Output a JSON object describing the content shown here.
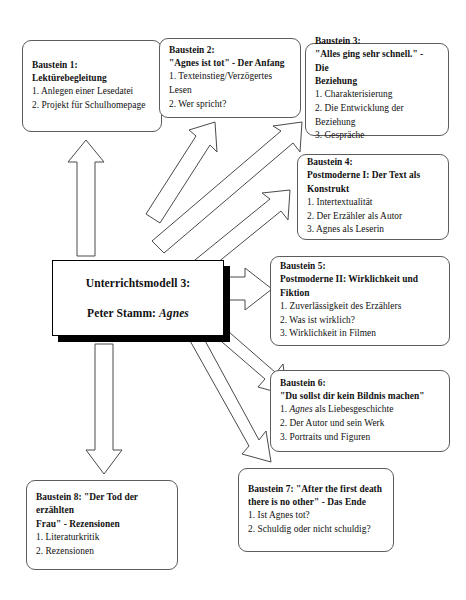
{
  "document": {
    "title": "Unterrichtsmodell 3: Peter Stamm: Agnes",
    "type": "organizational-flow-diagram"
  },
  "center_node": {
    "name": "unterrichtsmodell-center-node",
    "line1": "Unterrichtsmodell 3:",
    "line2_prefix": "Peter Stamm: ",
    "line2_italic": "Agnes"
  },
  "nodes": [
    {
      "id": "baustein-1",
      "heading_line1": "Baustein 1:",
      "heading_line2": "Lektürebegleitung",
      "items": [
        "1. Anlegen einer Lesedatei",
        "2. Projekt für Schulhomepage"
      ]
    },
    {
      "id": "baustein-2",
      "heading_line1": "Baustein 2:",
      "heading_line2": "\"Agnes ist tot\" - Der Anfang",
      "items": [
        "1. Texteinstieg/Verzögertes Lesen",
        "2. Wer spricht?"
      ]
    },
    {
      "id": "baustein-3",
      "heading_line1": "Baustein 3:",
      "heading_line2": "\"Alles ging sehr schnell.\" - Die",
      "heading_line3": "Beziehung",
      "items": [
        "1. Charakterisierung",
        "2. Die Entwicklung der Beziehung",
        "3. Gespräche"
      ]
    },
    {
      "id": "baustein-4",
      "heading_line1": "Baustein 4:",
      "heading_line2": "Postmoderne I: Der Text als",
      "heading_line3": "Konstrukt",
      "items": [
        "1. Intertextualität",
        "2. Der Erzähler als Autor",
        "3. Agnes als Leserin"
      ]
    },
    {
      "id": "baustein-5",
      "heading_line1": "Baustein 5:",
      "heading_line2": "Postmoderne II: Wirklichkeit und",
      "heading_line3": "Fiktion",
      "items": [
        "1. Zuverlässigkeit des Erzählers",
        "2. Was ist wirklich?",
        "3. Wirklichkeit in  Filmen"
      ]
    },
    {
      "id": "baustein-6",
      "heading_line1": "Baustein 6:",
      "heading_line2": "\"Du sollst dir kein Bildnis machen\"",
      "item1_italic": "Agnes",
      "item1_suffix": " als Liebesgeschichte",
      "item1_prefix": "1. ",
      "items": [
        "2. Der Autor und sein Werk",
        "3. Portraits und Figuren"
      ]
    },
    {
      "id": "baustein-7",
      "heading_line1": "Baustein 7: \"After the first death",
      "heading_line2": "there is no other\" - Das Ende",
      "items": [
        "1. Ist Agnes tot?",
        "2. Schuldig oder nicht schuldig?"
      ]
    },
    {
      "id": "baustein-8",
      "heading_line1": "Baustein 8: \"Der Tod der erzählten",
      "heading_line2": "Frau\" - Rezensionen",
      "items": [
        "1. Literaturkritik",
        "2. Rezensionen"
      ]
    }
  ],
  "connectors": [
    {
      "id": "arrow-to-baustein-1",
      "direction": "up"
    },
    {
      "id": "arrow-to-baustein-2",
      "direction": "up-right"
    },
    {
      "id": "arrow-to-baustein-3",
      "direction": "up-right"
    },
    {
      "id": "arrow-to-baustein-4",
      "direction": "up-right"
    },
    {
      "id": "arrow-to-baustein-5",
      "direction": "right"
    },
    {
      "id": "arrow-to-baustein-6",
      "direction": "down-right"
    },
    {
      "id": "arrow-to-baustein-7",
      "direction": "down-right"
    },
    {
      "id": "arrow-to-baustein-8",
      "direction": "down"
    }
  ],
  "colors": {
    "background": "#ffffff",
    "box_border": "#5c5c5c",
    "center_border": "#000000",
    "center_shadow": "#000000",
    "arrow_stroke": "#4a4a4a",
    "arrow_fill": "#ffffff",
    "text": "#111111"
  }
}
